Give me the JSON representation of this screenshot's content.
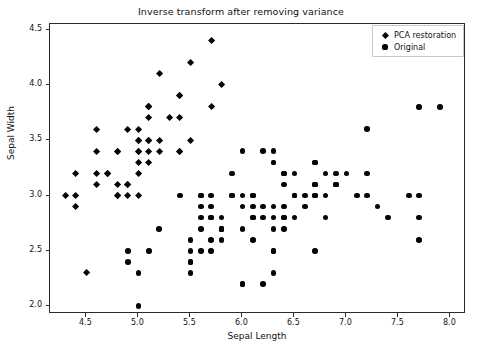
{
  "chart_data": {
    "type": "scatter",
    "title": "Inverse transform after removing variance",
    "xlabel": "Sepal Length",
    "ylabel": "Sepal Width",
    "xlim": [
      4.15,
      8.15
    ],
    "ylim": [
      1.93,
      4.55
    ],
    "xticks": [
      4.5,
      5.0,
      5.5,
      6.0,
      6.5,
      7.0,
      7.5,
      8.0
    ],
    "xticklabels": [
      "4.5",
      "5.0",
      "5.5",
      "6.0",
      "6.5",
      "7.0",
      "7.5",
      "8.0"
    ],
    "yticks": [
      2.0,
      2.5,
      3.0,
      3.5,
      4.0,
      4.5
    ],
    "yticklabels": [
      "2.0",
      "2.5",
      "3.0",
      "3.5",
      "4.0",
      "4.5"
    ],
    "grid": false,
    "legend_position": "upper right",
    "legend": [
      {
        "name": "PCA restoration",
        "marker": "diamond",
        "color": "#050505"
      },
      {
        "name": "Original",
        "marker": "circle",
        "color": "#050505"
      }
    ],
    "series": [
      {
        "name": "PCA restoration",
        "marker": "diamond",
        "color": "#050505",
        "points": [
          [
            5.1,
            3.5
          ],
          [
            4.9,
            3.0
          ],
          [
            4.7,
            3.2
          ],
          [
            4.6,
            3.1
          ],
          [
            5.0,
            3.6
          ],
          [
            5.4,
            3.9
          ],
          [
            4.6,
            3.4
          ],
          [
            5.0,
            3.4
          ],
          [
            4.4,
            2.9
          ],
          [
            4.9,
            3.1
          ],
          [
            5.4,
            3.7
          ],
          [
            4.8,
            3.4
          ],
          [
            4.8,
            3.0
          ],
          [
            4.3,
            3.0
          ],
          [
            5.8,
            4.0
          ],
          [
            5.7,
            4.4
          ],
          [
            5.4,
            3.9
          ],
          [
            5.1,
            3.5
          ],
          [
            5.7,
            3.8
          ],
          [
            5.1,
            3.8
          ],
          [
            5.4,
            3.4
          ],
          [
            5.1,
            3.7
          ],
          [
            4.6,
            3.6
          ],
          [
            5.1,
            3.3
          ],
          [
            4.8,
            3.4
          ],
          [
            5.0,
            3.0
          ],
          [
            5.0,
            3.4
          ],
          [
            5.2,
            3.5
          ],
          [
            5.2,
            3.4
          ],
          [
            4.7,
            3.2
          ],
          [
            4.8,
            3.1
          ],
          [
            5.4,
            3.4
          ],
          [
            5.2,
            4.1
          ],
          [
            5.5,
            4.2
          ],
          [
            4.9,
            3.1
          ],
          [
            5.0,
            3.2
          ],
          [
            5.5,
            3.5
          ],
          [
            4.9,
            3.6
          ],
          [
            4.4,
            3.0
          ],
          [
            5.1,
            3.4
          ],
          [
            5.0,
            3.5
          ],
          [
            4.5,
            2.3
          ],
          [
            4.4,
            3.2
          ],
          [
            5.0,
            3.5
          ],
          [
            5.1,
            3.8
          ],
          [
            4.8,
            3.0
          ],
          [
            5.1,
            3.8
          ],
          [
            4.6,
            3.2
          ],
          [
            5.3,
            3.7
          ],
          [
            5.0,
            3.3
          ]
        ]
      },
      {
        "name": "Original",
        "marker": "circle",
        "color": "#050505",
        "points": [
          [
            7.0,
            3.2
          ],
          [
            6.4,
            3.2
          ],
          [
            6.9,
            3.1
          ],
          [
            5.5,
            2.3
          ],
          [
            6.5,
            2.8
          ],
          [
            5.7,
            2.8
          ],
          [
            6.3,
            3.3
          ],
          [
            4.9,
            2.4
          ],
          [
            6.6,
            2.9
          ],
          [
            5.2,
            2.7
          ],
          [
            5.0,
            2.0
          ],
          [
            5.9,
            3.0
          ],
          [
            6.0,
            2.2
          ],
          [
            6.1,
            2.9
          ],
          [
            5.6,
            2.9
          ],
          [
            6.7,
            3.1
          ],
          [
            5.6,
            3.0
          ],
          [
            5.8,
            2.7
          ],
          [
            6.2,
            2.2
          ],
          [
            5.6,
            2.5
          ],
          [
            5.9,
            3.2
          ],
          [
            6.1,
            2.8
          ],
          [
            6.3,
            2.5
          ],
          [
            6.1,
            2.8
          ],
          [
            6.4,
            2.9
          ],
          [
            6.6,
            3.0
          ],
          [
            6.8,
            2.8
          ],
          [
            6.7,
            3.0
          ],
          [
            6.0,
            2.9
          ],
          [
            5.7,
            2.6
          ],
          [
            5.5,
            2.4
          ],
          [
            5.5,
            2.4
          ],
          [
            5.8,
            2.7
          ],
          [
            6.0,
            2.7
          ],
          [
            5.4,
            3.0
          ],
          [
            6.0,
            3.4
          ],
          [
            6.7,
            3.1
          ],
          [
            6.3,
            2.3
          ],
          [
            5.6,
            3.0
          ],
          [
            5.5,
            2.5
          ],
          [
            5.5,
            2.6
          ],
          [
            6.1,
            3.0
          ],
          [
            5.8,
            2.6
          ],
          [
            5.0,
            2.3
          ],
          [
            5.6,
            2.7
          ],
          [
            5.7,
            3.0
          ],
          [
            5.7,
            2.9
          ],
          [
            6.2,
            2.9
          ],
          [
            5.1,
            2.5
          ],
          [
            5.7,
            2.8
          ],
          [
            6.3,
            3.3
          ],
          [
            5.8,
            2.7
          ],
          [
            7.1,
            3.0
          ],
          [
            6.3,
            2.9
          ],
          [
            6.5,
            3.0
          ],
          [
            7.6,
            3.0
          ],
          [
            4.9,
            2.5
          ],
          [
            7.3,
            2.9
          ],
          [
            6.7,
            2.5
          ],
          [
            7.2,
            3.6
          ],
          [
            6.5,
            3.2
          ],
          [
            6.4,
            2.7
          ],
          [
            6.8,
            3.0
          ],
          [
            5.7,
            2.5
          ],
          [
            5.8,
            2.8
          ],
          [
            6.4,
            3.2
          ],
          [
            6.5,
            3.0
          ],
          [
            7.7,
            3.8
          ],
          [
            7.7,
            2.6
          ],
          [
            6.0,
            2.2
          ],
          [
            6.9,
            3.2
          ],
          [
            5.6,
            2.8
          ],
          [
            7.7,
            2.8
          ],
          [
            6.3,
            2.7
          ],
          [
            6.7,
            3.3
          ],
          [
            7.2,
            3.2
          ],
          [
            6.2,
            2.8
          ],
          [
            6.1,
            3.0
          ],
          [
            6.4,
            2.8
          ],
          [
            7.2,
            3.0
          ],
          [
            7.4,
            2.8
          ],
          [
            7.9,
            3.8
          ],
          [
            6.4,
            2.8
          ],
          [
            6.3,
            2.8
          ],
          [
            6.1,
            2.6
          ],
          [
            7.7,
            3.0
          ],
          [
            6.3,
            3.4
          ],
          [
            6.4,
            3.1
          ],
          [
            6.0,
            3.0
          ],
          [
            6.9,
            3.1
          ],
          [
            6.7,
            3.1
          ],
          [
            6.9,
            3.1
          ],
          [
            5.8,
            2.7
          ],
          [
            6.8,
            3.2
          ],
          [
            6.7,
            3.3
          ],
          [
            6.7,
            3.0
          ],
          [
            6.3,
            2.5
          ],
          [
            6.5,
            3.0
          ],
          [
            6.2,
            3.4
          ],
          [
            5.9,
            3.0
          ]
        ]
      }
    ]
  }
}
